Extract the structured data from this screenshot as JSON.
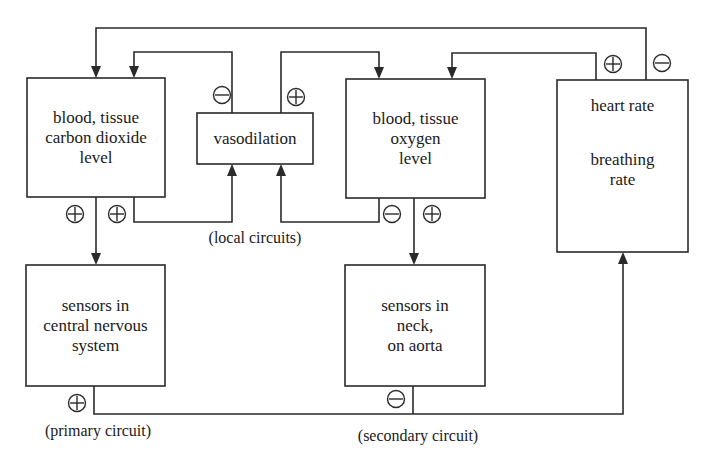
{
  "diagram": {
    "nodes": {
      "co2": {
        "lines": [
          "blood, tissue",
          "carbon dioxide",
          "level"
        ]
      },
      "vasodilation": {
        "lines": [
          "vasodilation"
        ]
      },
      "o2": {
        "lines": [
          "blood, tissue",
          "oxygen",
          "level"
        ]
      },
      "heart": {
        "lines": [
          "heart rate",
          "",
          "breathing",
          "rate"
        ]
      },
      "cns": {
        "lines": [
          "sensors in",
          "central nervous",
          "system"
        ]
      },
      "neck": {
        "lines": [
          "sensors in",
          "neck,",
          "on aorta"
        ]
      }
    },
    "captions": {
      "local": "(local circuits)",
      "primary": "(primary circuit)",
      "secondary": "(secondary circuit)"
    },
    "signs": [
      {
        "id": "vaso-to-co2",
        "symbol": "minus",
        "label": "⊖"
      },
      {
        "id": "vaso-to-o2",
        "symbol": "plus",
        "label": "⊕"
      },
      {
        "id": "co2-to-cns",
        "symbol": "plus",
        "label": "⊕"
      },
      {
        "id": "co2-to-vaso",
        "symbol": "plus",
        "label": "⊕"
      },
      {
        "id": "o2-to-vaso",
        "symbol": "minus",
        "label": "⊖"
      },
      {
        "id": "o2-to-neck",
        "symbol": "plus",
        "label": "⊕"
      },
      {
        "id": "heart-to-o2",
        "symbol": "plus",
        "label": "⊕"
      },
      {
        "id": "heart-to-co2",
        "symbol": "minus",
        "label": "⊖"
      },
      {
        "id": "cns-to-heart",
        "symbol": "plus",
        "label": "⊕"
      },
      {
        "id": "neck-to-heart",
        "symbol": "minus",
        "label": "⊖"
      }
    ],
    "colors": {
      "stroke": "#2a2a2a",
      "background": "#ffffff",
      "text": "#1a1a1a"
    }
  }
}
